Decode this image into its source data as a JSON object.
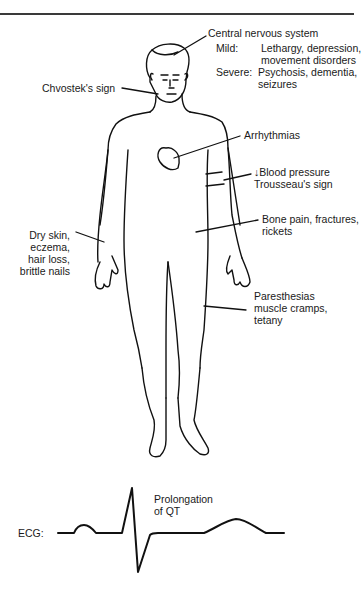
{
  "diagram": {
    "type": "annotated-body-figure",
    "labels": {
      "cns_title": "Central nervous system",
      "cns_mild_key": "Mild:",
      "cns_mild_value": "Lethargy, depression,\nmovement disorders",
      "cns_severe_key": "Severe:",
      "cns_severe_value": "Psychosis, dementia,\nseizures",
      "chvostek": "Chvostek's sign",
      "arrhythmias": "Arrhythmias",
      "blood_pressure": "↓Blood pressure",
      "trousseau": "Trousseau's sign",
      "bone_line1": "Bone pain, fractures,",
      "bone_line2": "rickets",
      "skin_line1": "Dry skin,",
      "skin_line2": "eczema,",
      "skin_line3": "hair loss,",
      "skin_line4": "brittle nails",
      "paresthesias_line1": "Paresthesias",
      "paresthesias_line2": "muscle cramps,",
      "paresthesias_line3": "tetany"
    },
    "ecg": {
      "label": "ECG:",
      "annotation_line1": "Prolongation",
      "annotation_line2": "of QT"
    },
    "colors": {
      "line": "#111111",
      "text": "#1a1a1a",
      "background": "#ffffff"
    }
  }
}
